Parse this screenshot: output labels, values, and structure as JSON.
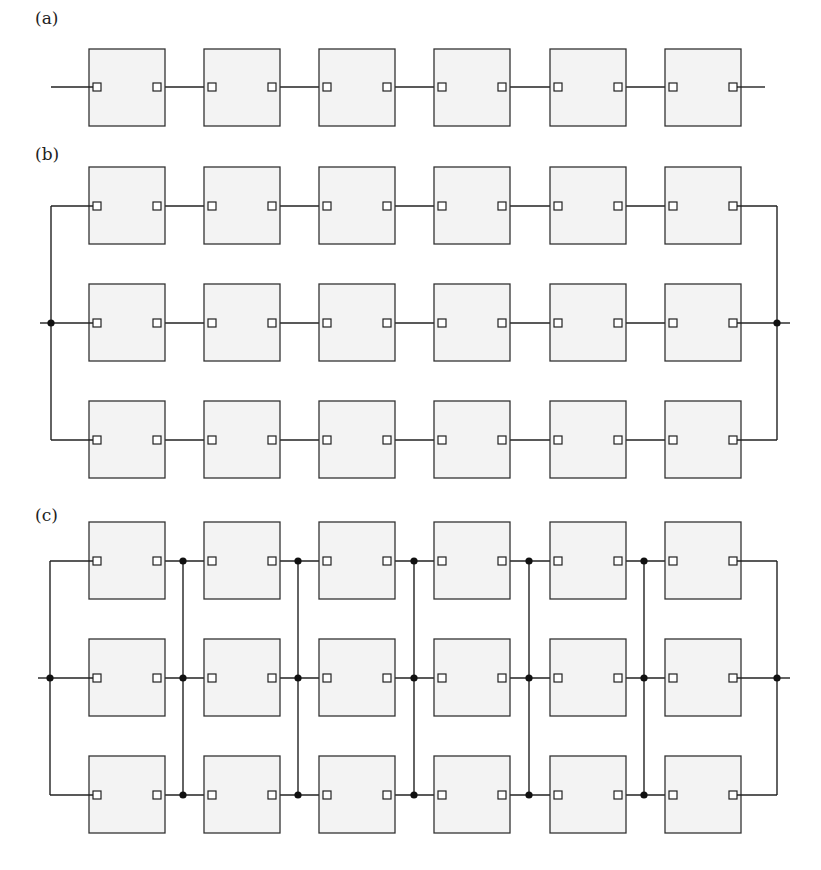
{
  "figure": {
    "panels": [
      {
        "id": "a",
        "label": "(a)",
        "label_pos": [
          35,
          8
        ],
        "description": "Single series string of 6 modules",
        "rows": [
          87
        ],
        "box_top": [
          49
        ],
        "left_bus": null,
        "right_bus": null,
        "lead_in": [
          51,
          87
        ],
        "lead_out": [
          765,
          87
        ],
        "cross_ties": []
      },
      {
        "id": "b",
        "label": "(b)",
        "label_pos": [
          35,
          144
        ],
        "description": "Three parallel strings of 6 modules (series-parallel)",
        "rows": [
          206,
          323,
          440
        ],
        "box_top": [
          167,
          284,
          401
        ],
        "left_bus": 51,
        "right_bus": 777,
        "lead_in": [
          40,
          323
        ],
        "lead_out": [
          790,
          323
        ],
        "cross_ties": []
      },
      {
        "id": "c",
        "label": "(c)",
        "label_pos": [
          35,
          505
        ],
        "description": "Total-cross-tied array of 6x3 modules",
        "rows": [
          561,
          678,
          795
        ],
        "box_top": [
          522,
          639,
          756
        ],
        "left_bus": 50,
        "right_bus": 777,
        "lead_in": [
          38,
          678
        ],
        "lead_out": [
          790,
          678
        ],
        "cross_ties": [
          183,
          298,
          414,
          529,
          644
        ]
      }
    ],
    "module": {
      "columns_x": [
        89,
        204,
        319,
        434,
        550,
        665
      ],
      "width": 76,
      "height": 77,
      "fill": "#f3f3f3",
      "stroke": "#333333",
      "port_size": 8
    },
    "colors": {
      "line": "#222222",
      "junction": "#111111"
    }
  }
}
